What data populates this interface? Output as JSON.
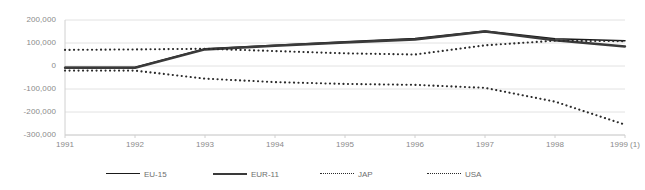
{
  "chart_data": {
    "type": "line",
    "title": "",
    "xlabel": "",
    "ylabel": "",
    "grid": true,
    "legend_position": "bottom",
    "ylim": [
      -300000,
      200000
    ],
    "yticks": [
      200000,
      100000,
      0,
      -100000,
      -200000,
      -300000
    ],
    "ytick_labels": [
      "200,000",
      "100,000",
      "0",
      "-100,000",
      "-200,000",
      "-300,000"
    ],
    "categories": [
      "1991",
      "1992",
      "1993",
      "1994",
      "1995",
      "1996",
      "1997",
      "1998",
      "1999 (1)"
    ],
    "series": [
      {
        "name": "EU-15",
        "style": "solid-thin",
        "color": "#1a1a1a",
        "values": [
          -5000,
          -5000,
          75000,
          90000,
          105000,
          120000,
          152000,
          118000,
          110000
        ]
      },
      {
        "name": "EUR-11",
        "style": "solid-thick",
        "color": "#3a3a3a",
        "values": [
          -8000,
          -8000,
          72000,
          88000,
          102000,
          115000,
          150000,
          112000,
          85000
        ]
      },
      {
        "name": "JAP",
        "style": "dotted",
        "color": "#2b2b2b",
        "values": [
          70000,
          72000,
          75000,
          65000,
          55000,
          50000,
          90000,
          110000,
          108000
        ]
      },
      {
        "name": "USA",
        "style": "dotted",
        "color": "#2b2b2b",
        "values": [
          -20000,
          -20000,
          -55000,
          -70000,
          -78000,
          -82000,
          -95000,
          -155000,
          -255000
        ]
      }
    ]
  },
  "legend": {
    "items": [
      {
        "label": "EU-15"
      },
      {
        "label": "EUR-11"
      },
      {
        "label": "JAP"
      },
      {
        "label": "USA"
      }
    ]
  },
  "axis_colors": {
    "grid": "#e2e2e2",
    "tick_text": "#8a8a8a",
    "axis_line": "#d0d0d0"
  }
}
